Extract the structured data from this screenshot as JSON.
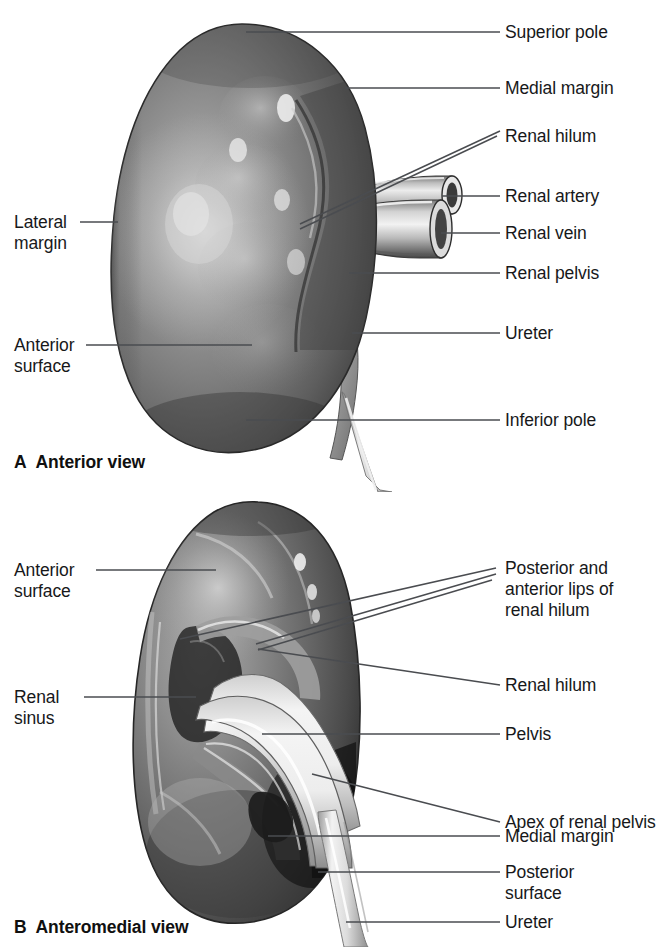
{
  "figure": {
    "line_color": "#4a4c50",
    "text_color": "#17181a"
  },
  "panels": [
    {
      "id": "A",
      "letter": "A",
      "caption": "Anterior view",
      "labels_right": [
        {
          "name": "superior-pole",
          "text": "Superior pole"
        },
        {
          "name": "medial-margin",
          "text": "Medial margin"
        },
        {
          "name": "renal-hilum",
          "text": "Renal hilum"
        },
        {
          "name": "renal-artery",
          "text": "Renal artery"
        },
        {
          "name": "renal-vein",
          "text": "Renal vein"
        },
        {
          "name": "renal-pelvis",
          "text": "Renal pelvis"
        },
        {
          "name": "ureter",
          "text": "Ureter"
        },
        {
          "name": "inferior-pole",
          "text": "Inferior pole"
        }
      ],
      "labels_left": [
        {
          "name": "lateral-margin",
          "text": "Lateral\nmargin"
        },
        {
          "name": "anterior-surface",
          "text": "Anterior\nsurface"
        }
      ]
    },
    {
      "id": "B",
      "letter": "B",
      "caption": "Anteromedial view",
      "labels_right": [
        {
          "name": "posterior-anterior-lips-of-renal-hilum",
          "text": "Posterior and\nanterior lips of\nrenal hilum"
        },
        {
          "name": "renal-hilum",
          "text": "Renal hilum"
        },
        {
          "name": "pelvis",
          "text": "Pelvis"
        },
        {
          "name": "apex-of-renal-pelvis",
          "text": "Apex of renal pelvis"
        },
        {
          "name": "medial-margin",
          "text": "Medial margin"
        },
        {
          "name": "posterior-surface",
          "text": "Posterior\nsurface"
        },
        {
          "name": "ureter",
          "text": "Ureter"
        }
      ],
      "labels_left": [
        {
          "name": "anterior-surface",
          "text": "Anterior\nsurface"
        },
        {
          "name": "renal-sinus",
          "text": "Renal\nsinus"
        }
      ]
    }
  ]
}
